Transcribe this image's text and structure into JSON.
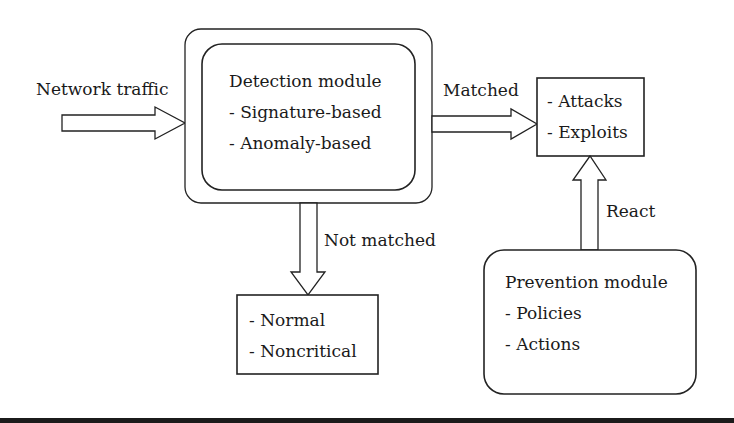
{
  "diagram": {
    "input_label": "Network traffic",
    "detection_module": {
      "title": "Detection module",
      "items": [
        "- Signature-based",
        "- Anomaly-based"
      ]
    },
    "matched_label": "Matched",
    "not_matched_label": "Not matched",
    "react_label": "React",
    "attacks_box": {
      "items": [
        "- Attacks",
        "- Exploits"
      ]
    },
    "normal_box": {
      "items": [
        "- Normal",
        "- Noncritical"
      ]
    },
    "prevention_module": {
      "title": "Prevention module",
      "items": [
        "- Policies",
        "- Actions"
      ]
    }
  },
  "colors": {
    "stroke": "#222222",
    "background": "#ffffff",
    "bottom_bar": "#1b1b1b"
  }
}
